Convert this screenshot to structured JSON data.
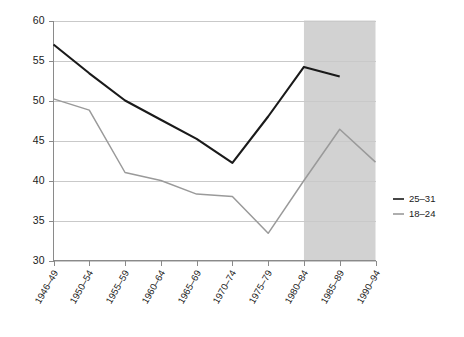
{
  "chart_data": {
    "type": "line",
    "title": "",
    "subtitle": "",
    "xlabel": "",
    "ylabel": "",
    "categories": [
      "1946–49",
      "1950–54",
      "1955–59",
      "1960–64",
      "1965–69",
      "1970–74",
      "1975–79",
      "1980–84",
      "1985–89",
      "1990–94"
    ],
    "ylim": [
      30,
      60
    ],
    "yticks": [
      30,
      35,
      40,
      45,
      50,
      55,
      60
    ],
    "ytick_labels": [
      "30",
      "35",
      "40",
      "45",
      "50",
      "55",
      "60"
    ],
    "grid": "horizontal",
    "legend_position": "right",
    "series": [
      {
        "name": "25–31",
        "color": "#1a1a1a",
        "width": 2.1,
        "values": [
          57.0,
          53.4,
          50.0,
          47.6,
          45.2,
          42.2,
          48.0,
          54.2,
          53.0,
          null
        ]
      },
      {
        "name": "18–24",
        "color": "#9a9a9a",
        "width": 1.5,
        "values": [
          50.2,
          48.8,
          41.0,
          40.0,
          38.3,
          38.0,
          33.4,
          40.0,
          46.4,
          42.3
        ]
      }
    ],
    "annotations": [
      {
        "kind": "shaded-band",
        "from_category": "1980–84",
        "to_category": "1990–94",
        "color": "#d2d2d2"
      }
    ]
  },
  "legend": {
    "entries": [
      {
        "label": "25–31"
      },
      {
        "label": "18–24"
      }
    ]
  }
}
